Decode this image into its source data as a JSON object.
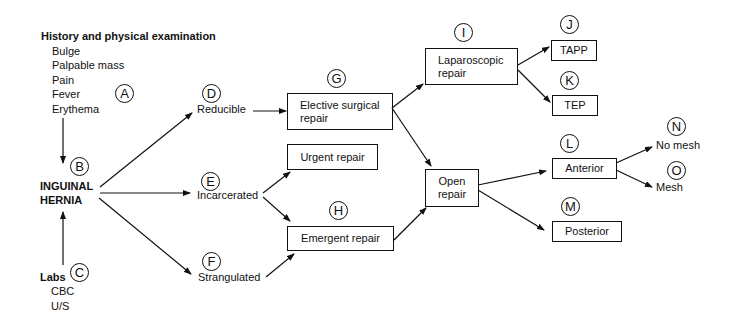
{
  "diagram": {
    "history": {
      "title": "History and physical examination",
      "items": [
        "Bulge",
        "Palpable mass",
        "Pain",
        "Fever",
        "Erythema"
      ],
      "marker": "A"
    },
    "center": {
      "line1": "INGUINAL",
      "line2": "HERNIA",
      "marker": "B"
    },
    "labs": {
      "title": "Labs",
      "items": [
        "CBC",
        "U/S"
      ],
      "marker": "C"
    },
    "states": [
      {
        "marker": "D",
        "label": "Reducible"
      },
      {
        "marker": "E",
        "label": "Incarcerated"
      },
      {
        "marker": "F",
        "label": "Strangulated"
      }
    ],
    "boxes": {
      "elective": {
        "marker": "G",
        "line1": "Elective surgical",
        "line2": "repair"
      },
      "urgent": {
        "label": "Urgent repair"
      },
      "emergent": {
        "marker": "H",
        "label": "Emergent repair"
      },
      "laparoscopic": {
        "marker": "I",
        "line1": "Laparoscopic",
        "line2": "repair"
      },
      "tapp": {
        "marker": "J",
        "label": "TAPP"
      },
      "tep": {
        "marker": "K",
        "label": "TEP"
      },
      "open": {
        "line1": "Open",
        "line2": "repair"
      },
      "anterior": {
        "marker": "L",
        "label": "Anterior"
      },
      "posterior": {
        "marker": "M",
        "label": "Posterior"
      }
    },
    "outcomes": [
      {
        "marker": "N",
        "label": "No mesh"
      },
      {
        "marker": "O",
        "label": "Mesh"
      }
    ]
  }
}
